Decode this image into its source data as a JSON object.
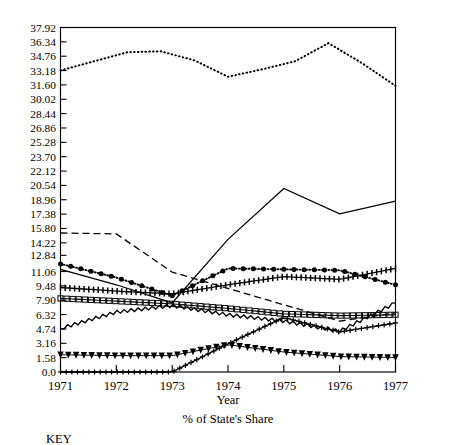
{
  "figure": {
    "cut_off_title": "",
    "key_heading": "KEY"
  },
  "chart_data": {
    "type": "line",
    "title": "",
    "xlabel": "Year",
    "ylabel": "",
    "caption": "% of State's Share",
    "grid": false,
    "legend_position": "below-chart",
    "x": [
      1971,
      1972,
      1973,
      1974,
      1975,
      1976,
      1977
    ],
    "xticklabels": [
      "1971",
      "1972",
      "1973",
      "1974",
      "1975",
      "1976",
      "1977"
    ],
    "xlim": [
      1971,
      1977
    ],
    "ylim": [
      0.0,
      37.92
    ],
    "yticklabels": [
      "37.92",
      "36.34",
      "34.76",
      "33.18",
      "31.60",
      "30.02",
      "28.44",
      "26.86",
      "25.28",
      "23.70",
      "22.12",
      "20.54",
      "18.96",
      "17.38",
      "15.80",
      "14.22",
      "12.84",
      "11.06",
      "9.48",
      "7.90",
      "6.32",
      "4.74",
      "3.16",
      "1.58",
      "0.0"
    ],
    "ytickvalues": [
      37.92,
      36.34,
      34.76,
      33.18,
      31.6,
      30.02,
      28.44,
      26.86,
      25.28,
      23.7,
      22.12,
      20.54,
      18.96,
      17.38,
      15.8,
      14.22,
      12.84,
      11.06,
      9.48,
      7.9,
      6.32,
      4.74,
      3.16,
      1.58,
      0.0
    ],
    "series": [
      {
        "name": "series-dotted-top",
        "marker": "dotted",
        "style": "dotted",
        "values": [
          33.2,
          34.9,
          35.3,
          32.5,
          34.4,
          36.2,
          31.5
        ],
        "mid_values": [
          33.2,
          34.2,
          35.2,
          35.3,
          34.3,
          32.5,
          33.3,
          34.2,
          36.2,
          34.0,
          31.5
        ]
      },
      {
        "name": "series-solid-rising",
        "marker": "none",
        "style": "solid",
        "values": [
          11.3,
          9.6,
          7.6,
          14.6,
          20.2,
          17.4,
          18.8
        ]
      },
      {
        "name": "series-dashed",
        "marker": "dashed",
        "style": "dashed",
        "values": [
          15.3,
          15.2,
          11.0,
          9.2,
          7.4,
          5.6,
          6.5
        ]
      },
      {
        "name": "series-filled-circles",
        "marker": "circle",
        "style": "dotted-marker",
        "values": [
          11.9,
          10.4,
          8.4,
          11.4,
          11.3,
          11.2,
          9.6
        ]
      },
      {
        "name": "series-tick-band",
        "marker": "tick-band",
        "style": "hatched",
        "values": [
          9.3,
          8.9,
          8.6,
          9.6,
          10.5,
          10.2,
          11.4
        ]
      },
      {
        "name": "series-square-ladder",
        "marker": "square",
        "style": "ladder",
        "values": [
          8.1,
          7.8,
          7.5,
          7.0,
          6.4,
          6.2,
          6.3
        ]
      },
      {
        "name": "series-solid-jagged",
        "marker": "none",
        "style": "solid-jagged",
        "values": [
          4.8,
          6.6,
          7.3,
          6.3,
          5.6,
          4.5,
          7.6
        ]
      },
      {
        "name": "series-triangles",
        "marker": "triangle-down",
        "style": "marker-line",
        "values": [
          1.9,
          1.8,
          1.8,
          3.0,
          2.2,
          1.7,
          1.6
        ]
      },
      {
        "name": "series-plus-band",
        "marker": "plus",
        "style": "marker-line",
        "values": [
          0.0,
          0.0,
          0.0,
          3.1,
          6.0,
          4.4,
          5.4
        ]
      }
    ]
  }
}
